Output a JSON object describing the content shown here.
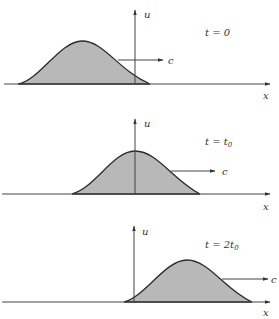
{
  "figure": {
    "colors": {
      "fill": "#b8b8b8",
      "stroke": "#2a2a2a",
      "axis": "#444444",
      "background": "#ffffff"
    },
    "axis_labels": {
      "vertical": "u",
      "horizontal": "x"
    },
    "speed_label": "c",
    "panels": [
      {
        "time_label": "t = 0",
        "time_main": "t = 0",
        "time_sub": ""
      },
      {
        "time_label": "t = t0",
        "time_main": "t = t",
        "time_sub": "0"
      },
      {
        "time_label": "t = 2t0",
        "time_main": "t = 2t",
        "time_sub": "0"
      }
    ]
  }
}
